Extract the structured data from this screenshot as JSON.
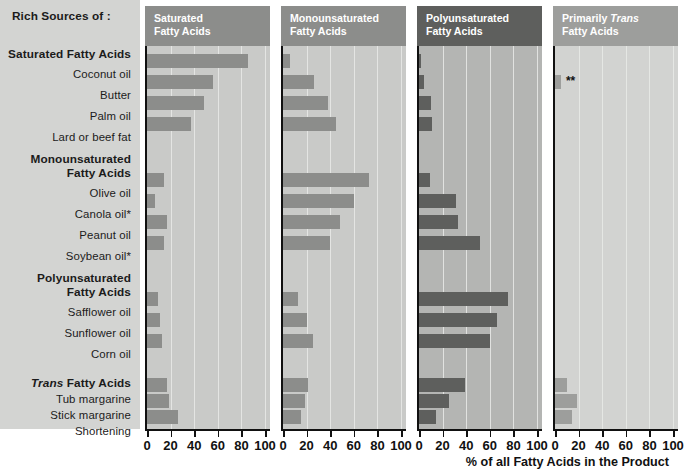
{
  "title": "Rich Sources of :",
  "axis_title": "% of all Fatty Acids in the Product",
  "groups": [
    {
      "heading": "Saturated Fatty Acids",
      "heading_italic_prefix": ""
    },
    {
      "heading": "Monounsaturated",
      "heading2": "Fatty Acids"
    },
    {
      "heading": "Polyunsaturated",
      "heading2": "Fatty Acids"
    },
    {
      "heading_italic_prefix": "Trans",
      "heading": " Fatty Acids"
    }
  ],
  "row_labels": [
    "Coconut oil",
    "Butter",
    "Palm oil",
    "Lard or beef fat",
    "Olive oil",
    "Canola oil*",
    "Peanut oil",
    "Soybean oil*",
    "Safflower oil",
    "Sunflower oil",
    "Corn oil",
    "Tub margarine",
    "Stick margarine",
    "Shortening"
  ],
  "panel_titles": [
    {
      "line1": "Saturated",
      "line2": "Fatty Acids",
      "italic_word": ""
    },
    {
      "line1": "Monounsaturated",
      "line2": "Fatty Acids",
      "italic_word": ""
    },
    {
      "line1": "Polyunsaturated",
      "line2": "Fatty Acids",
      "italic_word": ""
    },
    {
      "line1": "Primarily ",
      "line2": "Fatty Acids",
      "italic_word": "Trans"
    }
  ],
  "tick_values": [
    "0",
    "20",
    "40",
    "60",
    "80",
    "100"
  ],
  "marker_note": "**",
  "colors": {
    "label_panel_bg": "#d3d4d2",
    "panel_header_bg_1": "#8c8d8b",
    "panel_header_bg_2": "#8c8d8b",
    "panel_header_bg_3": "#5e5f5d",
    "panel_header_bg_4": "#9d9e9c",
    "plot_bg_1": "#c9cac8",
    "plot_bg_2": "#c9cac8",
    "plot_bg_3": "#b4b5b3",
    "plot_bg_4": "#d2d3d1",
    "bar_1": "#8c8d8b",
    "bar_2": "#8c8d8b",
    "bar_3": "#5e5f5d",
    "bar_4": "#9d9e9c",
    "gridline": "#e9eae8",
    "axis": "#111111"
  },
  "chart_data": {
    "type": "bar",
    "title": "Rich Sources of :",
    "xlabel": "% of all Fatty Acids in the Product",
    "ylabel": "",
    "xlim": [
      0,
      100
    ],
    "grid": true,
    "orientation": "horizontal",
    "legend": "none",
    "categories": [
      "Coconut oil",
      "Butter",
      "Palm oil",
      "Lard or beef fat",
      "Olive oil",
      "Canola oil*",
      "Peanut oil",
      "Soybean oil*",
      "Safflower oil",
      "Sunflower oil",
      "Corn oil",
      "Tub margarine",
      "Stick margarine",
      "Shortening"
    ],
    "series": [
      {
        "name": "Saturated Fatty Acids",
        "values": [
          86,
          56,
          48,
          37,
          14,
          7,
          17,
          14,
          9,
          11,
          13,
          17,
          19,
          26
        ]
      },
      {
        "name": "Monounsaturated Fatty Acids",
        "values": [
          6,
          26,
          38,
          45,
          73,
          60,
          48,
          40,
          13,
          20,
          25,
          21,
          19,
          15
        ]
      },
      {
        "name": "Polyunsaturated Fatty Acids",
        "values": [
          2,
          4,
          10,
          11,
          9,
          31,
          33,
          52,
          75,
          66,
          60,
          39,
          25,
          14
        ]
      },
      {
        "name": "Primarily Trans Fatty Acids",
        "values": [
          0,
          5,
          0,
          0,
          0,
          0,
          0,
          0,
          0,
          0,
          0,
          10,
          19,
          14
        ]
      }
    ],
    "annotations": [
      {
        "series": "Primarily Trans Fatty Acids",
        "category": "Butter",
        "text": "**"
      }
    ]
  }
}
